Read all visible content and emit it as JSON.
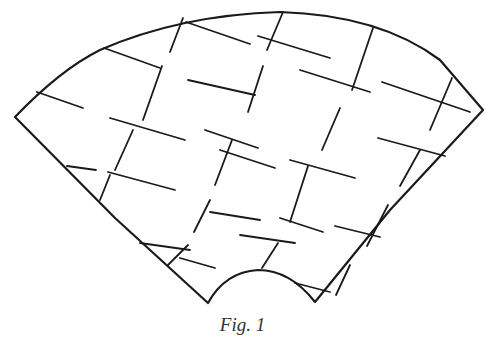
{
  "figure": {
    "caption": "Fig. 1",
    "stroke_color": "#1a1a1a",
    "outline": "M15,117 Q60,70 100,50 Q180,15 280,12 Q380,15 440,60 L483,110 L390,210 L315,302 Q290,270 258,270 Q225,272 208,303 L115,218 Z",
    "grid_lines": [
      "M37,92 L83,108",
      "M104,48 L160,68",
      "M186,22 L250,44",
      "M258,36 L330,58",
      "M110,118 L185,140",
      "M188,80 L255,95",
      "M300,70 L370,92",
      "M382,82 L470,112",
      "M67,166 L96,170",
      "M108,172 L175,190",
      "M205,130 L258,148",
      "M220,150 L275,168",
      "M290,160 L355,178",
      "M378,138 L445,156",
      "M140,243 L190,250",
      "M180,258 L215,268",
      "M210,212 L260,220",
      "M240,235 L295,243",
      "M280,218 L323,232",
      "M335,226 L380,237",
      "M295,283 L330,292",
      "M183,18 L170,52",
      "M162,66 L143,120",
      "M133,130 L115,170",
      "M110,175 L100,200",
      "M283,12 L267,50",
      "M263,66 L248,112",
      "M232,140 L215,185",
      "M210,200 L194,232",
      "M188,245 L168,265",
      "M373,28 L352,90",
      "M340,108 L322,150",
      "M308,166 L290,222",
      "M278,243 L262,268",
      "M452,78 L430,130",
      "M420,150 L400,186",
      "M388,205 L367,246",
      "M350,265 L336,295"
    ]
  }
}
